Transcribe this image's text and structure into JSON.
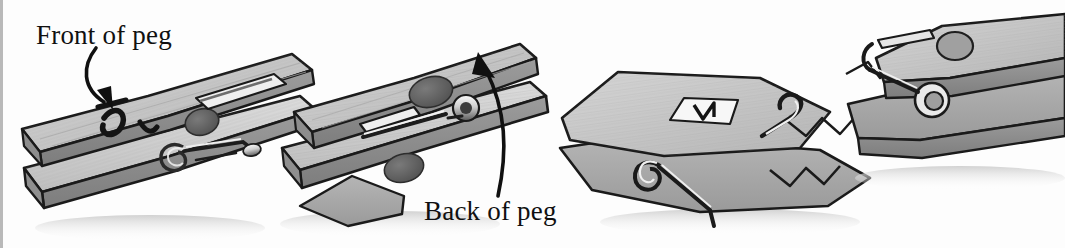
{
  "figure": {
    "kind": "illustration",
    "background_color": "#fdfdfd",
    "palette": {
      "outline": "#1a1a1a",
      "wood_light": "#d2d2d2",
      "wood_mid": "#a9a9a9",
      "wood_dark": "#8a8a8a",
      "wood_shadow": "#6f6f6f",
      "metal_light": "#f2f2f2",
      "metal_dark": "#4a4a4a",
      "spot_dark": "#5e5e5e",
      "sticker_white": "#f7f7f7",
      "drop_shadow": "#d8d8d8",
      "edge_rule": "#b9b9b9"
    },
    "labels": [
      {
        "id": "front",
        "text": "Front of peg",
        "x": 36,
        "y": 22,
        "font_size": 27,
        "points_to": "first peg upper arm, front face"
      },
      {
        "id": "back",
        "text": "Back of peg",
        "x": 424,
        "y": 198,
        "font_size": 27,
        "points_to": "second peg upper arm, back face"
      }
    ],
    "arrows": [
      {
        "id": "front-arrow",
        "from": [
          105,
          46
        ],
        "to": [
          112,
          108
        ],
        "curve": "bows left then hooks down-right",
        "head": "filled triangle"
      },
      {
        "id": "back-arrow",
        "from": [
          498,
          196
        ],
        "to": [
          482,
          56
        ],
        "curve": "sweeps up and bends left",
        "head": "filled triangle"
      }
    ],
    "pegs": [
      {
        "id": "peg-1",
        "view": "front",
        "orientation": "tilted up to the right, jaws open to the left",
        "marks": [
          "hook-shaped pen mark",
          "dark knot spot",
          "metal spring with coil"
        ]
      },
      {
        "id": "peg-2",
        "view": "back",
        "orientation": "tilted up to the right, jaws open to the left",
        "marks": [
          "two dark oval spots",
          "metal spring bar with coil"
        ]
      },
      {
        "id": "peg-3",
        "view": "back",
        "orientation": "lying flat, jaws open to the right",
        "marks": [
          "white sticker with V mark",
          "metal spring bar",
          "coil spring"
        ]
      },
      {
        "id": "peg-4",
        "view": "front",
        "orientation": "tilted, jaws open to the left, partly cropped at right edge",
        "marks": [
          "dark oval spot",
          "metal coil spring"
        ]
      }
    ]
  }
}
